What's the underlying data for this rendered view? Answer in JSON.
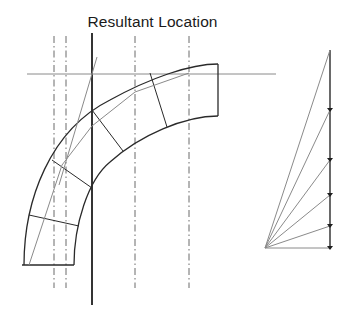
{
  "title": "Resultant Location",
  "colors": {
    "outline": "#2a2a2a",
    "thin_line": "#8a8a8a",
    "dashed_line": "#5a5a5a",
    "background": "#ffffff"
  },
  "figure": {
    "left_diagram": {
      "description": "Curved arch/bend segment divided into voussoir blocks with line of thrust and vertical action lines",
      "dashed_vertical_lines": 4,
      "resultant_line": "solid vertical line marking resultant location",
      "horizontal_reference_line": true,
      "block_divisions": 4
    },
    "right_diagram": {
      "description": "Force polygon with rays from a single pole to points along a vertical load line",
      "ray_count": 6,
      "load_line_points": 6
    }
  }
}
